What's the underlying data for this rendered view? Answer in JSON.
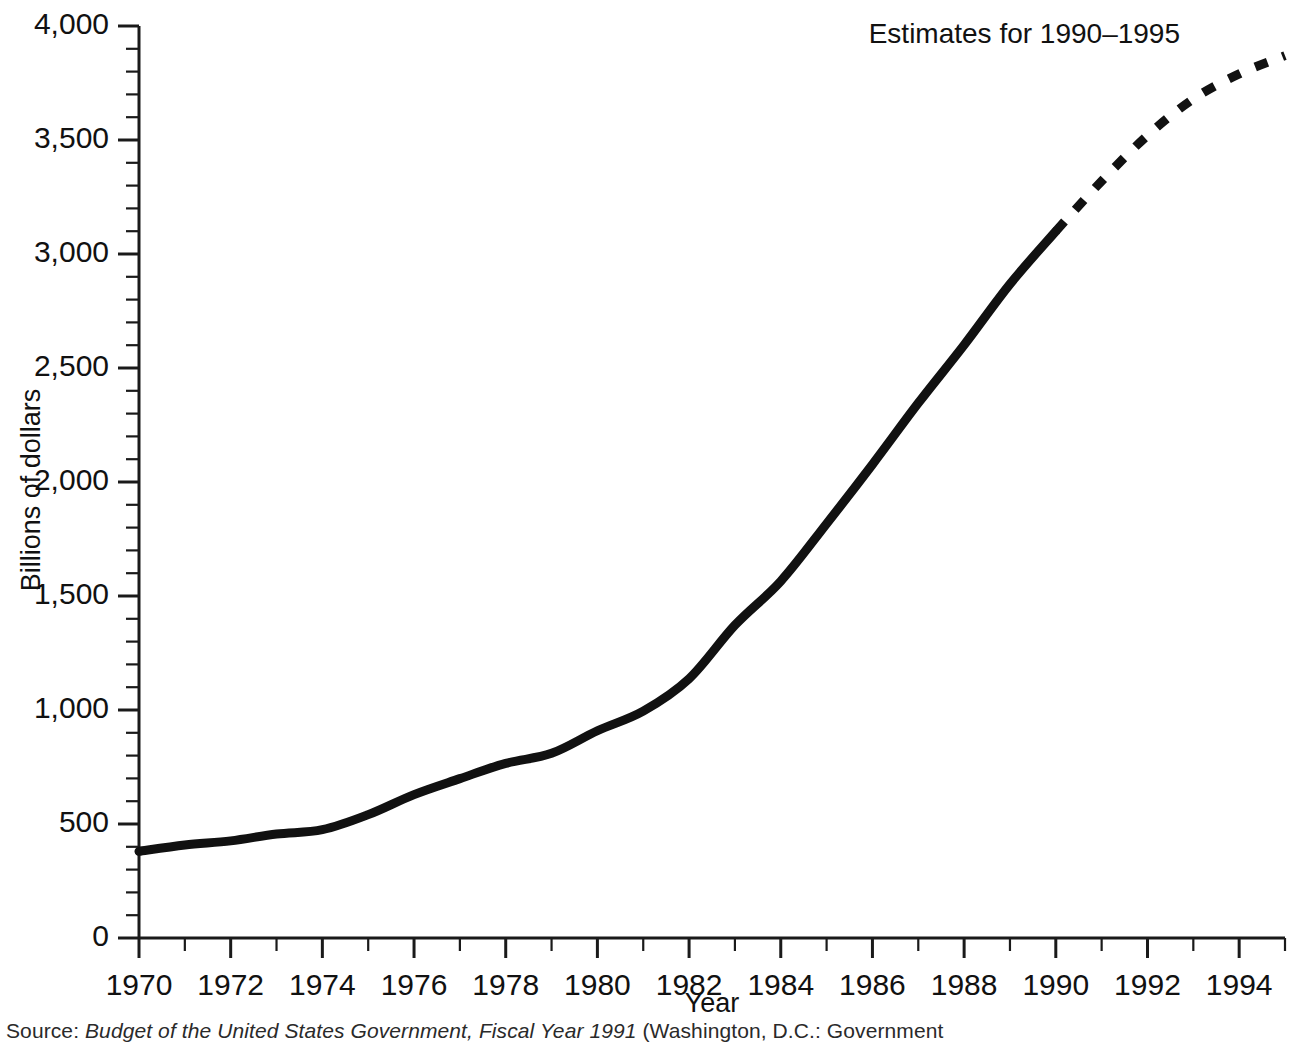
{
  "figure": {
    "annotation": "Estimates for 1990–1995",
    "source_label": "Source:",
    "source_title": "Budget of the United States Government, Fiscal Year 1991",
    "source_rest": "(Washington, D.C.: Government"
  },
  "chart_data": {
    "type": "line",
    "title": "",
    "subtitle": "",
    "xlabel": "Year",
    "ylabel": "Billions of dollars",
    "xlim": [
      1970,
      1995
    ],
    "ylim": [
      0,
      4000
    ],
    "grid": false,
    "legend": "none",
    "annotations": [
      "Estimates for 1990–1995"
    ],
    "y_tick_labels": [
      "0",
      "500",
      "1,000",
      "1,500",
      "2,000",
      "2,500",
      "3,000",
      "3,500",
      "4,000"
    ],
    "y_ticks": [
      0,
      500,
      1000,
      1500,
      2000,
      2500,
      3000,
      3500,
      4000
    ],
    "y_minor_step": 100,
    "x_tick_labels": [
      "1970",
      "1972",
      "1974",
      "1976",
      "1978",
      "1980",
      "1982",
      "1984",
      "1986",
      "1988",
      "1990",
      "1992",
      "1994"
    ],
    "x_ticks": [
      1970,
      1972,
      1974,
      1976,
      1978,
      1980,
      1982,
      1984,
      1986,
      1988,
      1990,
      1992,
      1994
    ],
    "x_minor_step": 1,
    "line_color": "#111111",
    "series": [
      {
        "name": "Actual",
        "style": "solid",
        "x": [
          1970,
          1971,
          1972,
          1973,
          1974,
          1975,
          1976,
          1977,
          1978,
          1979,
          1980,
          1981,
          1982,
          1983,
          1984,
          1985,
          1986,
          1987,
          1988,
          1989,
          1990
        ],
        "values": [
          380,
          408,
          426,
          456,
          475,
          541,
          629,
          699,
          766,
          810,
          909,
          995,
          1137,
          1372,
          1565,
          1817,
          2077,
          2346,
          2601,
          2868,
          3100
        ]
      },
      {
        "name": "Estimates",
        "style": "dashed",
        "x": [
          1990,
          1991,
          1992,
          1993,
          1994,
          1995
        ],
        "values": [
          3100,
          3320,
          3520,
          3680,
          3790,
          3870
        ]
      }
    ]
  }
}
